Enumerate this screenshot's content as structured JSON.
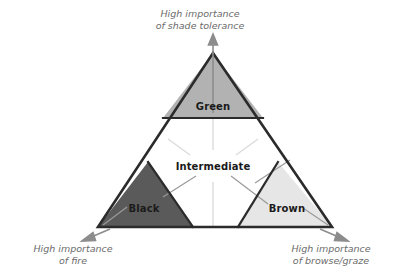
{
  "figure": {
    "type": "ternary-concept-triangle",
    "axes": [
      {
        "id": "shade-tolerance",
        "position": "top",
        "text": "High importance\nof shade tolerance",
        "arrow_direction": "up"
      },
      {
        "id": "fire",
        "position": "bottom-left",
        "text": "High importance\nof fire",
        "arrow_direction": "down-left"
      },
      {
        "id": "browse-graze",
        "position": "bottom-right",
        "text": "High importance\nof browse/graze",
        "arrow_direction": "down-right"
      }
    ],
    "zones": [
      {
        "id": "green",
        "label": "Green",
        "fill": "#b2b2b2",
        "corner": "top"
      },
      {
        "id": "black",
        "label": "Black",
        "fill": "#5a5a5a",
        "corner": "bottom-left"
      },
      {
        "id": "brown",
        "label": "Brown",
        "fill": "#e6e6e6",
        "corner": "bottom-right"
      },
      {
        "id": "intermediate",
        "label": "Intermediate",
        "fill": "#ffffff",
        "corner": "center"
      }
    ],
    "colors": {
      "outline": "#2b2b2b",
      "leader_line": "#9a9a9a",
      "faint_line": "#dcdcdc",
      "arrow": "#8c8c8c",
      "axis_text": "#6b6b6b",
      "zone_text": "#1a1a1a",
      "background": "#ffffff"
    }
  }
}
